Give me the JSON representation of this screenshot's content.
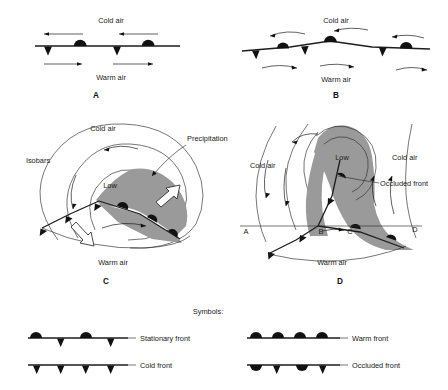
{
  "figure": {
    "background_color": "#ffffff",
    "ink_color": "#1a1a1a",
    "precipitation_color": "#9a9a9a"
  },
  "panels": [
    {
      "letter": "A",
      "name": "stationary-front-stage",
      "labels": {
        "cold_air": "Cold air",
        "warm_air": "Warm air"
      },
      "front_type": "stationary",
      "semicircle_count": 2,
      "triangle_count": 2,
      "cold_air_arrow_count": 2,
      "warm_air_arrow_count": 2,
      "cold_air_arrow_direction": "left",
      "warm_air_arrow_direction": "right"
    },
    {
      "letter": "B",
      "name": "wave-development-stage",
      "labels": {
        "cold_air": "Cold air",
        "warm_air": "Warm air"
      },
      "front_type": "stationary-with-wave",
      "semicircle_count": 3,
      "triangle_count": 3,
      "cold_air_arrow_count": 3,
      "warm_air_arrow_count": 3,
      "cold_air_arrow_direction": "left",
      "warm_air_arrow_direction": "right"
    },
    {
      "letter": "C",
      "name": "open-wave-cyclone-stage",
      "labels": {
        "cold_air": "Cold air",
        "warm_air": "Warm air",
        "isobars": "Isobars",
        "precipitation": "Precipitation",
        "low": "Low"
      },
      "isobar_count": 3,
      "has_precipitation_shading": true,
      "white_arrow_count": 2,
      "white_arrow_meaning": "front movement direction"
    },
    {
      "letter": "D",
      "name": "occlusion-stage",
      "labels": {
        "cold_air_left": "Cold air",
        "cold_air_right": "Cold air",
        "warm_air": "Warm air",
        "low": "Low",
        "occluded_front": "Occluded front"
      },
      "cross_section_points": [
        "A",
        "B",
        "C",
        "D"
      ],
      "isobar_count": 4,
      "has_precipitation_shading": true
    }
  ],
  "legend": {
    "heading": "Symbols:",
    "items": [
      {
        "name": "stationary-front",
        "label": "Stationary front",
        "pattern": "alternating semicircle above / triangle below",
        "column": "left"
      },
      {
        "name": "cold-front",
        "label": "Cold front",
        "pattern": "triangles below",
        "column": "left"
      },
      {
        "name": "warm-front",
        "label": "Warm front",
        "pattern": "semicircles above",
        "column": "right"
      },
      {
        "name": "occluded-front",
        "label": "Occluded front",
        "pattern": "alternating semicircle and triangle below",
        "column": "right"
      }
    ]
  }
}
